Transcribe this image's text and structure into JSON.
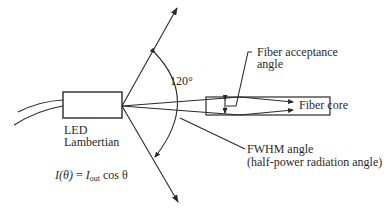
{
  "diagram": {
    "angle_label": "120°",
    "led_label_line1": "LED",
    "led_label_line2": "Lambertian",
    "fiber_acceptance_line1": "Fiber acceptance",
    "fiber_acceptance_line2": "angle",
    "fiber_core_label": "Fiber core",
    "fwhm_line1": "FWHM angle",
    "fwhm_line2": "(half-power radiation angle)",
    "equation": {
      "lhs": "I(θ)",
      "equals": "=",
      "rhs_I": "I",
      "rhs_sub": "out",
      "rhs_rest": "cos θ"
    },
    "colors": {
      "line": "#2a2a2a",
      "background": "#ffffff"
    }
  }
}
